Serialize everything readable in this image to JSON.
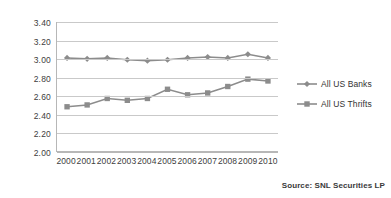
{
  "chart_data": {
    "type": "line",
    "title": "",
    "subtitle": "",
    "xlabel": "",
    "ylabel": "",
    "categories": [
      "2000",
      "2001",
      "2002",
      "2003",
      "2004",
      "2005",
      "2006",
      "2007",
      "2008",
      "2009",
      "2010"
    ],
    "series": [
      {
        "name": "All US Banks",
        "marker": "diamond",
        "color": "#8c8c8c",
        "values": [
          3.01,
          3.0,
          3.01,
          2.99,
          2.98,
          2.99,
          3.01,
          3.02,
          3.01,
          3.05,
          3.01
        ]
      },
      {
        "name": "All US Thrifts",
        "marker": "square",
        "color": "#8c8c8c",
        "values": [
          2.48,
          2.5,
          2.57,
          2.55,
          2.57,
          2.67,
          2.61,
          2.63,
          2.7,
          2.78,
          2.76
        ]
      }
    ],
    "ylim": [
      2.0,
      3.4
    ],
    "ytick_step": 0.2,
    "ytick_labels": [
      "3.40",
      "3.20",
      "3.00",
      "2.80",
      "2.60",
      "2.40",
      "2.20",
      "2.00"
    ],
    "ytick_values": [
      3.4,
      3.2,
      3.0,
      2.8,
      2.6,
      2.4,
      2.2,
      2.0
    ],
    "grid": true,
    "grid_color": "#c9c9c9",
    "axis_color": "#b7b7b7",
    "legend_position": "right"
  },
  "legend": {
    "items": [
      {
        "label": "All US Banks"
      },
      {
        "label": "All US Thrifts"
      }
    ]
  },
  "footer": {
    "source": "Source: SNL Securities LP"
  }
}
